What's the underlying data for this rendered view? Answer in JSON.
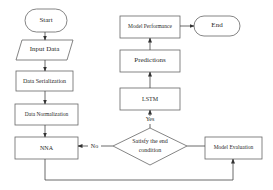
{
  "diagram": {
    "type": "flowchart",
    "colors": {
      "stroke": "#5a5a5a",
      "fill": "#ffffff",
      "text": "#2a2a2a"
    },
    "nodes": {
      "start": {
        "label": "Start",
        "shape": "terminator"
      },
      "input_data": {
        "label": "Input Data",
        "shape": "parallelogram"
      },
      "data_serialization": {
        "label": "Data Serialization",
        "shape": "process"
      },
      "data_normalization": {
        "label": "Data Normalization",
        "shape": "process"
      },
      "nna": {
        "label": "NNA",
        "shape": "process"
      },
      "model_evaluation": {
        "label": "Model Evaluation",
        "shape": "process"
      },
      "decision": {
        "label_line1": "Satisfy the end",
        "label_line2": "condition",
        "shape": "decision"
      },
      "lstm": {
        "label": "LSTM",
        "shape": "process"
      },
      "predictions": {
        "label": "Predictions",
        "shape": "process"
      },
      "model_performance": {
        "label": "Model Performance",
        "shape": "process"
      },
      "end": {
        "label": "End",
        "shape": "terminator"
      }
    },
    "edges": [
      {
        "from": "start",
        "to": "input_data",
        "label": ""
      },
      {
        "from": "input_data",
        "to": "data_serialization",
        "label": ""
      },
      {
        "from": "data_serialization",
        "to": "data_normalization",
        "label": ""
      },
      {
        "from": "data_normalization",
        "to": "nna",
        "label": ""
      },
      {
        "from": "nna",
        "to": "model_evaluation",
        "label": ""
      },
      {
        "from": "model_evaluation",
        "to": "decision",
        "label": ""
      },
      {
        "from": "decision",
        "to": "nna",
        "label": "No"
      },
      {
        "from": "decision",
        "to": "lstm",
        "label": "Yes"
      },
      {
        "from": "lstm",
        "to": "predictions",
        "label": ""
      },
      {
        "from": "predictions",
        "to": "model_performance",
        "label": ""
      },
      {
        "from": "model_performance",
        "to": "end",
        "label": ""
      }
    ],
    "edge_labels": {
      "no": "No",
      "yes": "Yes"
    }
  }
}
